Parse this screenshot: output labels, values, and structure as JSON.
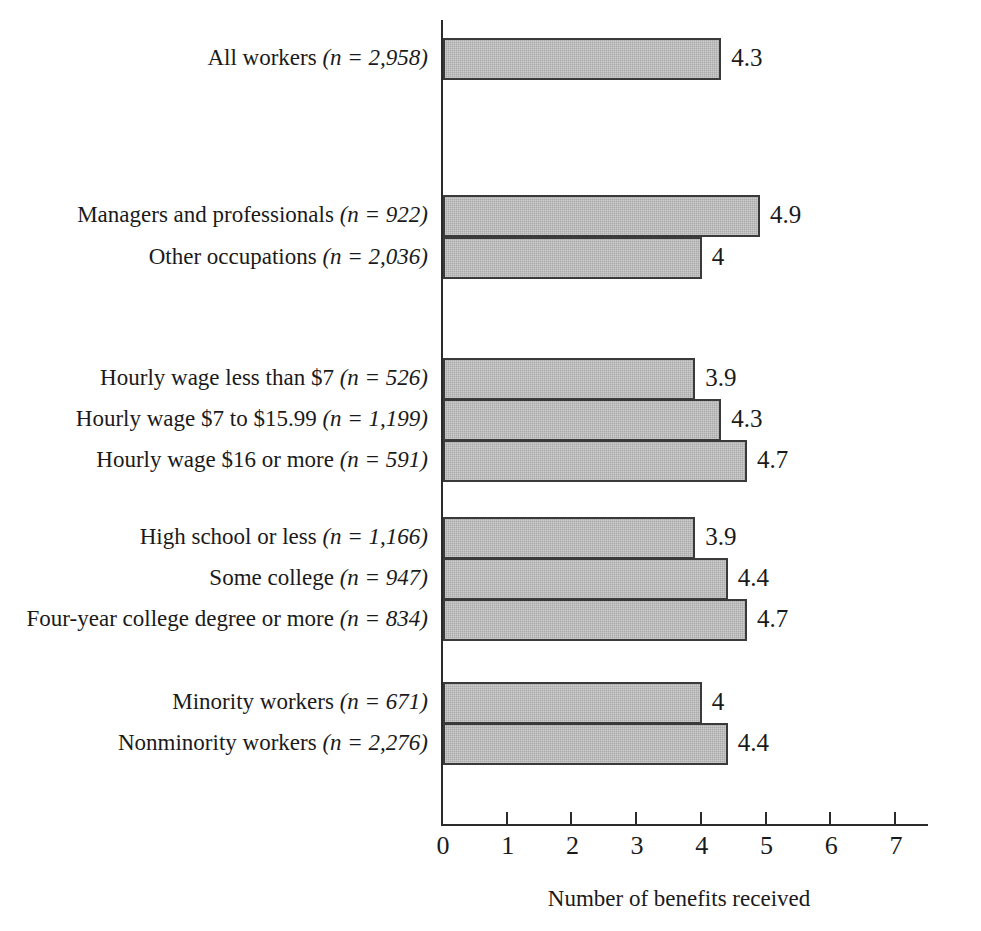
{
  "chart_data": {
    "type": "bar",
    "orientation": "horizontal",
    "title": "",
    "subtitle": "",
    "xlabel": "Number of benefits received",
    "ylabel": "",
    "xlim": [
      0,
      7
    ],
    "xticks": [
      0,
      1,
      2,
      3,
      4,
      5,
      6,
      7
    ],
    "xtick_labels": [
      "0",
      "1",
      "2",
      "3",
      "4",
      "5",
      "6",
      "7"
    ],
    "grid": false,
    "legend": null,
    "bar_color": "#aaaaaa",
    "bar_edge_color": "#3a3a3a",
    "categories": [
      "All workers (n = 2,958)",
      "Managers and professionals (n = 922)",
      "Other occupations (n = 2,036)",
      "Hourly wage less than $7 (n = 526)",
      "Hourly wage $7 to $15.99 (n = 1,199)",
      "Hourly wage $16 or more (n = 591)",
      "High school or less (n = 1,166)",
      "Some college (n = 947)",
      "Four-year college degree or more (n = 834)",
      "Minority workers (n = 671)",
      "Nonminority workers (n = 2,276)"
    ],
    "values": [
      4.3,
      4.9,
      4,
      3.9,
      4.3,
      4.7,
      3.9,
      4.4,
      4.7,
      4,
      4.4
    ],
    "value_labels": [
      "4.3",
      "4.9",
      "4",
      "3.9",
      "4.3",
      "4.7",
      "3.9",
      "4.4",
      "4.7",
      "4",
      "4.4"
    ],
    "groups": [
      {
        "name": "all",
        "rows": [
          {
            "label_plain": "All workers ",
            "label_italic": "(n = 2,958)",
            "value": 4.3,
            "value_label": "4.3"
          }
        ]
      },
      {
        "name": "occupation",
        "rows": [
          {
            "label_plain": "Managers and professionals ",
            "label_italic": "(n = 922)",
            "value": 4.9,
            "value_label": "4.9"
          },
          {
            "label_plain": "Other occupations ",
            "label_italic": "(n = 2,036)",
            "value": 4,
            "value_label": "4"
          }
        ]
      },
      {
        "name": "hourly-wage",
        "rows": [
          {
            "label_plain": "Hourly wage less than $7 ",
            "label_italic": "(n = 526)",
            "value": 3.9,
            "value_label": "3.9"
          },
          {
            "label_plain": "Hourly wage $7 to $15.99 ",
            "label_italic": "(n = 1,199)",
            "value": 4.3,
            "value_label": "4.3"
          },
          {
            "label_plain": "Hourly wage $16 or more ",
            "label_italic": "(n = 591)",
            "value": 4.7,
            "value_label": "4.7"
          }
        ]
      },
      {
        "name": "education",
        "rows": [
          {
            "label_plain": "High school or less ",
            "label_italic": "(n = 1,166)",
            "value": 3.9,
            "value_label": "3.9"
          },
          {
            "label_plain": "Some college ",
            "label_italic": "(n = 947)",
            "value": 4.4,
            "value_label": "4.4"
          },
          {
            "label_plain": "Four-year college degree or more ",
            "label_italic": "(n = 834)",
            "value": 4.7,
            "value_label": "4.7"
          }
        ]
      },
      {
        "name": "minority-status",
        "rows": [
          {
            "label_plain": "Minority workers ",
            "label_italic": "(n = 671)",
            "value": 4,
            "value_label": "4"
          },
          {
            "label_plain": "Nonminority workers ",
            "label_italic": "(n = 2,276)",
            "value": 4.4,
            "value_label": "4.4"
          }
        ]
      }
    ]
  },
  "layout": {
    "origin_x": 443,
    "px_per_unit": 64.7,
    "bar_height": 42,
    "row_tops": [
      38,
      195,
      237,
      358,
      399,
      440,
      517,
      558,
      599,
      682,
      723
    ]
  }
}
